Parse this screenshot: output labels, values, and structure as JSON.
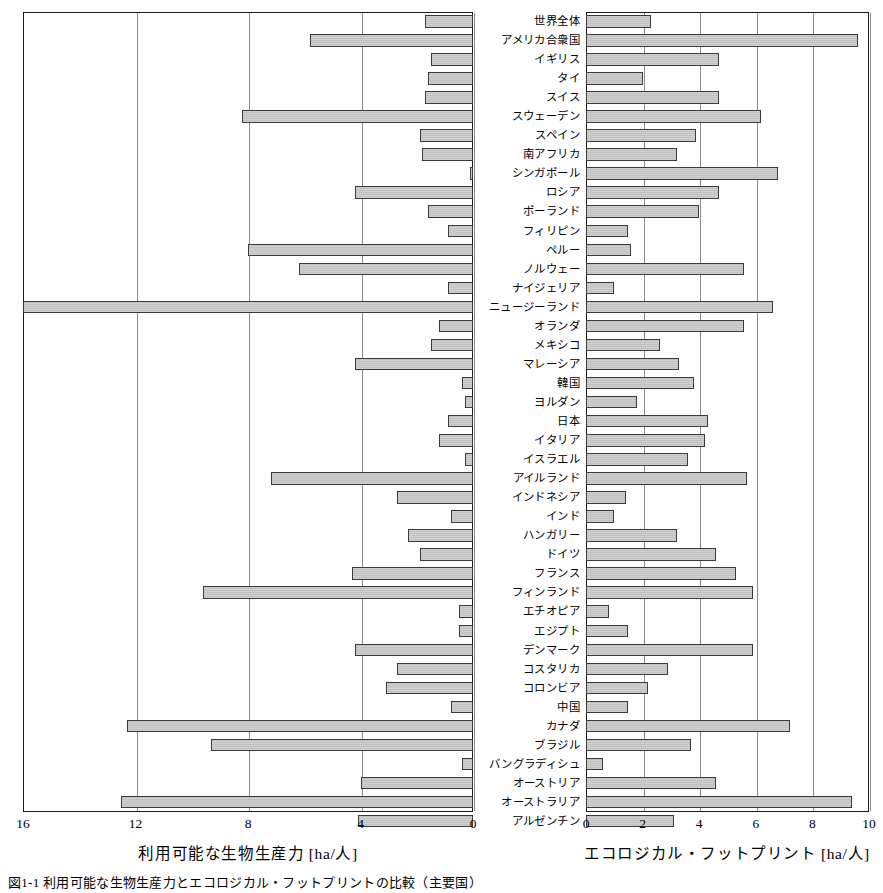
{
  "figure": {
    "caption": "図1-1 利用可能な生物生産力とエコロジカル・フットプリントの比較（主要国）"
  },
  "left_axis": {
    "title": "利用可能な生物生産力 [ha/人]",
    "ticks": [
      "16",
      "12",
      "8",
      "4",
      "0"
    ],
    "tick_values": [
      16,
      12,
      8,
      4,
      0
    ],
    "min": 0,
    "max": 16,
    "reversed": true
  },
  "right_axis": {
    "title": "エコロジカル・フットプリント [ha/人]",
    "ticks": [
      "0",
      "2",
      "4",
      "6",
      "8",
      "10"
    ],
    "tick_values": [
      0,
      2,
      4,
      6,
      8,
      10
    ],
    "min": 0,
    "max": 10,
    "reversed": false
  },
  "colors": {
    "bar_fill": "#c8c8c8",
    "bar_stroke": "#3a3a3a",
    "frame": "#1a1a1a",
    "gridline": "#8a8a8a",
    "text": "#000000"
  },
  "chart_data": {
    "type": "bar",
    "title": "",
    "subtitle": "",
    "orientation": "horizontal",
    "layout": "back-to-back butterfly / tornado, two panels sharing a central category axis",
    "grid": true,
    "legend": null,
    "xlabel_left": "利用可能な生物生産力 [ha/人]",
    "xlabel_right": "エコロジカル・フットプリント [ha/人]",
    "ylabel": "",
    "xlim_left": [
      0,
      16
    ],
    "xlim_right": [
      0,
      10
    ],
    "categories": [
      "世界全体",
      "アメリカ合衆国",
      "イギリス",
      "タイ",
      "スイス",
      "スウェーデン",
      "スペイン",
      "南アフリカ",
      "シンガポール",
      "ロシア",
      "ポーランド",
      "フィリピン",
      "ペルー",
      "ノルウェー",
      "ナイジェリア",
      "ニュージーランド",
      "オランダ",
      "メキシコ",
      "マレーシア",
      "韓国",
      "ヨルダン",
      "日本",
      "イタリア",
      "イスラエル",
      "アイルランド",
      "インドネシア",
      "インド",
      "ハンガリー",
      "ドイツ",
      "フランス",
      "フィンランド",
      "エチオピア",
      "エジプト",
      "デンマーク",
      "コスタリカ",
      "コロンビア",
      "中国",
      "カナダ",
      "ブラジル",
      "バングラディシュ",
      "オーストリア",
      "オーストラリア",
      "アルゼンチン"
    ],
    "series": [
      {
        "name": "利用可能な生物生産力 [ha/人]",
        "panel": "left",
        "values": [
          1.7,
          5.8,
          1.5,
          1.6,
          1.7,
          8.2,
          1.9,
          1.8,
          0.1,
          4.2,
          1.6,
          0.9,
          8.0,
          6.2,
          0.9,
          16.0,
          1.2,
          1.5,
          4.2,
          0.4,
          0.3,
          0.9,
          1.2,
          0.3,
          7.2,
          2.7,
          0.8,
          2.3,
          1.9,
          4.3,
          9.6,
          0.5,
          0.5,
          4.2,
          2.7,
          3.1,
          0.8,
          12.3,
          9.3,
          0.4,
          4.0,
          12.5,
          4.1
        ]
      },
      {
        "name": "エコロジカル・フットプリント [ha/人]",
        "panel": "right",
        "values": [
          2.3,
          9.6,
          4.7,
          2.0,
          4.7,
          6.2,
          3.9,
          3.2,
          6.8,
          4.7,
          4.0,
          1.5,
          1.6,
          5.6,
          1.0,
          6.6,
          5.6,
          2.6,
          3.3,
          3.8,
          1.8,
          4.3,
          4.2,
          3.6,
          5.7,
          1.4,
          1.0,
          3.2,
          4.6,
          5.3,
          5.9,
          0.8,
          1.5,
          5.9,
          2.9,
          2.2,
          1.5,
          7.2,
          3.7,
          0.6,
          4.6,
          9.4,
          3.1
        ]
      }
    ]
  }
}
